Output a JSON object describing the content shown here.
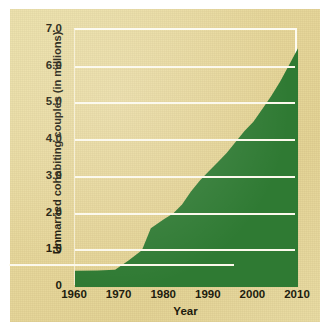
{
  "chart_data": {
    "type": "area",
    "title": "",
    "xlabel": "Year",
    "ylabel": "Unmarried cohabiting couples (in millions)",
    "xlim": [
      1960,
      2010
    ],
    "ylim": [
      0,
      7.0
    ],
    "grid": true,
    "legend": "none",
    "series_color": "#2f7a33",
    "background_color": "#e7d79a",
    "gridline_color": "#fcf9ec",
    "xticklabels": [
      "1960",
      "1970",
      "1980",
      "1990",
      "2000",
      "2010"
    ],
    "xticks": [
      1960,
      1970,
      1980,
      1990,
      2000,
      2010
    ],
    "yticklabels": [
      "0",
      "1.0",
      "2.0",
      "3.0",
      "4.0",
      "5.0",
      "6.0",
      "7.0"
    ],
    "yticks": [
      0,
      1.0,
      2.0,
      3.0,
      4.0,
      5.0,
      6.0,
      7.0
    ],
    "x": [
      1960,
      1965,
      1969,
      1972,
      1975,
      1977,
      1980,
      1982,
      1984,
      1986,
      1988,
      1990,
      1992,
      1994,
      1996,
      1998,
      2000,
      2002,
      2004,
      2006,
      2008,
      2010
    ],
    "values": [
      0.44,
      0.45,
      0.47,
      0.72,
      1.0,
      1.6,
      1.85,
      2.0,
      2.25,
      2.6,
      2.9,
      3.15,
      3.4,
      3.65,
      3.95,
      4.25,
      4.5,
      4.85,
      5.2,
      5.6,
      6.05,
      6.5
    ],
    "series": [
      {
        "name": "Unmarried cohabiting couples",
        "values": [
          0.44,
          0.45,
          0.47,
          0.72,
          1.0,
          1.6,
          1.85,
          2.0,
          2.25,
          2.6,
          2.9,
          3.15,
          3.4,
          3.65,
          3.95,
          4.25,
          4.5,
          4.85,
          5.2,
          5.6,
          6.05,
          6.5
        ]
      }
    ],
    "annotations": []
  },
  "axes": {
    "y_title": "Unmarried cohabiting couples (in millions)",
    "x_title": "Year",
    "y_ticks": [
      {
        "label": "7.0",
        "value": 7.0
      },
      {
        "label": "6.0",
        "value": 6.0
      },
      {
        "label": "5.0",
        "value": 5.0
      },
      {
        "label": "4.0",
        "value": 4.0
      },
      {
        "label": "3.0",
        "value": 3.0
      },
      {
        "label": "2.0",
        "value": 2.0
      },
      {
        "label": "1.0",
        "value": 1.0
      },
      {
        "label": "0",
        "value": 0
      }
    ],
    "x_ticks": [
      {
        "label": "1960",
        "value": 1960
      },
      {
        "label": "1970",
        "value": 1970
      },
      {
        "label": "1980",
        "value": 1980
      },
      {
        "label": "1990",
        "value": 1990
      },
      {
        "label": "2000",
        "value": 2000
      },
      {
        "label": "2010",
        "value": 2010
      }
    ]
  }
}
